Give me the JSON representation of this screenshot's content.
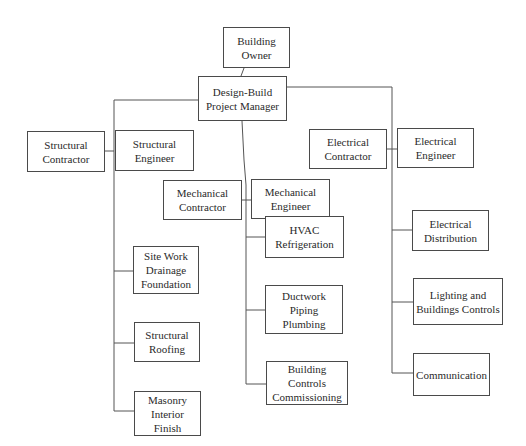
{
  "diagram": {
    "type": "org-chart",
    "colors": {
      "box_border": "#4a4a4a",
      "line": "#555555",
      "text": "#2a2a2a",
      "background": "#ffffff"
    },
    "nodes": {
      "owner": {
        "label": "Building\nOwner"
      },
      "pm": {
        "label": "Design-Build\nProject Manager"
      },
      "structural_contractor": {
        "label": "Structural\nContractor"
      },
      "structural_engineer": {
        "label": "Structural\nEngineer"
      },
      "mechanical_contractor": {
        "label": "Mechanical\nContractor"
      },
      "mechanical_engineer": {
        "label": "Mechanical\nEngineer"
      },
      "electrical_contractor": {
        "label": "Electrical\nContractor"
      },
      "electrical_engineer": {
        "label": "Electrical\nEngineer"
      },
      "site_work": {
        "label": "Site Work\nDrainage\nFoundation"
      },
      "structural_roofing": {
        "label": "Structural\nRoofing"
      },
      "masonry": {
        "label": "Masonry\nInterior Finish"
      },
      "hvac": {
        "label": "HVAC\nRefrigeration"
      },
      "ductwork": {
        "label": "Ductwork\nPiping\nPlumbing"
      },
      "building_controls": {
        "label": "Building Controls\nCommissioning"
      },
      "electrical_distribution": {
        "label": "Electrical\nDistribution"
      },
      "lighting": {
        "label": "Lighting and\nBuildings Controls"
      },
      "communication": {
        "label": "Communication"
      }
    },
    "edges": [
      [
        "owner",
        "pm"
      ],
      [
        "pm",
        "structural_engineer"
      ],
      [
        "pm",
        "mechanical_engineer"
      ],
      [
        "pm",
        "electrical_engineer"
      ],
      [
        "structural_contractor",
        "structural_engineer"
      ],
      [
        "mechanical_contractor",
        "mechanical_engineer"
      ],
      [
        "electrical_contractor",
        "electrical_engineer"
      ],
      [
        "structural_engineer",
        "site_work"
      ],
      [
        "structural_engineer",
        "structural_roofing"
      ],
      [
        "structural_engineer",
        "masonry"
      ],
      [
        "mechanical_engineer",
        "hvac"
      ],
      [
        "mechanical_engineer",
        "ductwork"
      ],
      [
        "mechanical_engineer",
        "building_controls"
      ],
      [
        "electrical_engineer",
        "electrical_distribution"
      ],
      [
        "electrical_engineer",
        "lighting"
      ],
      [
        "electrical_engineer",
        "communication"
      ]
    ]
  }
}
